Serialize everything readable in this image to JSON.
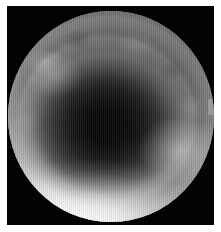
{
  "image": {
    "kind": "endoscopic-photograph",
    "modality": "white-light endoscopy",
    "color_mode": "grayscale",
    "field_of_view_shape": "circular",
    "frame_color": "#030303",
    "page_background": "#ffffff",
    "alt_text": "Grayscale endoscopic view of a tubular mucosal lumen receding to a dark center"
  },
  "scene": {
    "lumen_label": "central lumen",
    "wall_label": "mucosal wall",
    "highlight_label": "specular highlight",
    "fold_label": "concentric mucosal folds"
  },
  "tones": {
    "lumen_darkest": "#050505",
    "lumen_mid": "#1d1d1d",
    "wall_mid": "#8e8e8e",
    "wall_light": "#c2c2c2",
    "specular_white": "#f6f6f6",
    "rim_shadow": "#6f6f6f"
  },
  "geometry": {
    "canvas_width": 221,
    "canvas_height": 232,
    "margin": 6,
    "frame_left": 7,
    "frame_top": 6,
    "frame_width": 207,
    "frame_height": 219,
    "fov_diameter_x": 206,
    "fov_diameter_y": 211,
    "lumen_center_x": 105,
    "lumen_center_y": 120
  },
  "caption": ""
}
